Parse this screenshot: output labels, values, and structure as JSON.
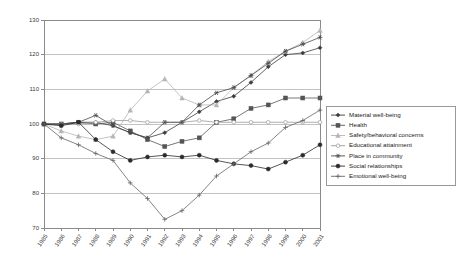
{
  "chart_data": {
    "type": "line",
    "title": "",
    "xlabel": "",
    "ylabel": "",
    "ylim": [
      70,
      130
    ],
    "yticks": [
      70,
      80,
      90,
      100,
      110,
      120,
      130
    ],
    "grid": true,
    "legend_position": "right",
    "categories": [
      "1985",
      "1986",
      "1987",
      "1988",
      "1989",
      "1990",
      "1991",
      "1992",
      "1993",
      "1994",
      "1995",
      "1996",
      "1997",
      "1998",
      "1999",
      "2000",
      "2001"
    ],
    "series": [
      {
        "name": "Material well-being",
        "color": "#3b3b3b",
        "marker": "diamond",
        "values": [
          100,
          100,
          100.5,
          100.5,
          99.5,
          97.5,
          96,
          97.5,
          100.5,
          103.5,
          106.5,
          108,
          112,
          116.5,
          120,
          120.5,
          122
        ]
      },
      {
        "name": "Health",
        "color": "#555555",
        "marker": "square",
        "values": [
          100,
          100,
          100.5,
          100,
          100.5,
          98,
          95.5,
          93.5,
          95,
          96,
          100.5,
          101.5,
          104.5,
          105.5,
          107.5,
          107.5,
          107.5
        ]
      },
      {
        "name": "Safety/behavioral concerns",
        "color": "#b5b5b5",
        "marker": "triangle",
        "values": [
          100,
          98,
          96.5,
          95.5,
          96.5,
          104,
          109.5,
          113,
          107.5,
          105.5,
          105.5,
          110.5,
          114,
          118,
          121,
          123.5,
          127
        ]
      },
      {
        "name": "Educational attainment",
        "color": "#9a9a9a",
        "marker": "circle-open",
        "values": [
          100,
          100,
          100,
          100.5,
          101,
          101,
          100.5,
          100.5,
          100.5,
          101,
          100.5,
          100.5,
          100.5,
          100.5,
          100.5,
          100.5,
          100.5
        ]
      },
      {
        "name": "Place in community",
        "color": "#4a4a4a",
        "marker": "star",
        "values": [
          100,
          100,
          100.5,
          102.5,
          99.5,
          97.5,
          96,
          100.5,
          100.5,
          105.5,
          109,
          110.5,
          114,
          117.5,
          121,
          123,
          125
        ]
      },
      {
        "name": "Social relationships",
        "color": "#2b2b2b",
        "marker": "circle",
        "values": [
          100,
          99.5,
          100.5,
          95.5,
          92,
          89.5,
          90.5,
          91,
          90.5,
          91,
          89.5,
          88.5,
          88,
          87,
          89,
          91,
          94
        ]
      },
      {
        "name": "Emotional well-being",
        "color": "#666666",
        "marker": "plus",
        "values": [
          100,
          96,
          94,
          91.5,
          89.5,
          83,
          78.5,
          72.5,
          75,
          79.5,
          85,
          88.5,
          92,
          94.5,
          99,
          101,
          104
        ]
      }
    ]
  },
  "legend": {
    "items": [
      {
        "label": "Material well-being"
      },
      {
        "label": "Health"
      },
      {
        "label": "Safety/behavioral concerns"
      },
      {
        "label": "Educational attainment"
      },
      {
        "label": "Place in community"
      },
      {
        "label": "Social relationships"
      },
      {
        "label": "Emotional well-being"
      }
    ]
  }
}
